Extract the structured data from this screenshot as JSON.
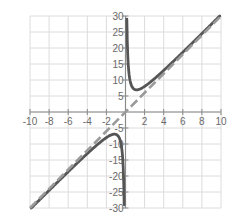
{
  "chart_data": {
    "type": "line",
    "title": "",
    "xlabel": "",
    "ylabel": "",
    "xlim": [
      -10,
      10
    ],
    "ylim": [
      -30,
      30
    ],
    "grid": true,
    "legend": null,
    "x_ticks": [
      -10,
      -8,
      -6,
      -4,
      -2,
      2,
      4,
      6,
      8,
      10
    ],
    "x_tick_labels": [
      "-10",
      "-8",
      "-6",
      "-4",
      "-2",
      "2",
      "4",
      "6",
      "8",
      "10"
    ],
    "y_ticks": [
      30,
      25,
      20,
      15,
      10,
      5,
      -5,
      -10,
      -15,
      -20,
      -25,
      -30
    ],
    "y_tick_labels": [
      "30",
      "25",
      "20",
      "15",
      "10",
      "5",
      "-5",
      "-10",
      "-15",
      "-20",
      "-25",
      "-30"
    ],
    "series": [
      {
        "name": "curve",
        "style": "solid",
        "expression": "y = 3x + 4/x",
        "branches": [
          {
            "x": [
              0.14,
              0.2,
              0.3,
              0.5,
              0.8,
              1.0,
              1.15,
              1.5,
              2,
              3,
              4,
              5,
              6,
              7,
              8,
              9,
              9.87
            ],
            "y": [
              29.0,
              20.6,
              14.2,
              9.5,
              7.4,
              7.0,
              6.93,
              7.17,
              8.0,
              10.33,
              13.0,
              15.8,
              18.67,
              21.57,
              24.5,
              27.44,
              30.0
            ]
          },
          {
            "x": [
              -9.87,
              -9,
              -8,
              -7,
              -6,
              -5,
              -4,
              -3,
              -2,
              -1.5,
              -1.15,
              -1.0,
              -0.8,
              -0.5,
              -0.3,
              -0.2,
              -0.14
            ],
            "y": [
              -30.0,
              -27.44,
              -24.5,
              -21.57,
              -18.67,
              -15.8,
              -13.0,
              -10.33,
              -8.0,
              -7.17,
              -6.93,
              -7.0,
              -7.4,
              -9.5,
              -14.2,
              -20.6,
              -29.0
            ]
          }
        ],
        "color": "#555555"
      },
      {
        "name": "asymptote",
        "style": "dashed",
        "expression": "y = 3x",
        "x": [
          -10,
          10
        ],
        "y": [
          -30,
          30
        ],
        "color": "#9a9a9a"
      }
    ],
    "vertical_asymptote": {
      "x": 0
    }
  },
  "colors": {
    "grid": "#dcdcdc",
    "axis": "#8a8a8a",
    "curve": "#555555",
    "asymptote": "#9a9a9a"
  }
}
